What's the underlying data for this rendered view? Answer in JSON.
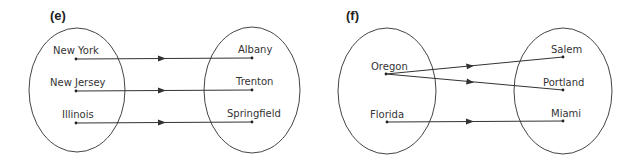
{
  "panels": [
    {
      "label": "(e)",
      "domain": [
        "New York",
        "New Jersey",
        "Illinois"
      ],
      "codomain": [
        "Albany",
        "Trenton",
        "Springfield"
      ],
      "mappings": [
        {
          "from": "New York",
          "to": "Albany"
        },
        {
          "from": "New Jersey",
          "to": "Trenton"
        },
        {
          "from": "Illinois",
          "to": "Springfield"
        }
      ]
    },
    {
      "label": "(f)",
      "domain": [
        "Oregon",
        "Florida"
      ],
      "codomain": [
        "Salem",
        "Portland",
        "Miami"
      ],
      "mappings": [
        {
          "from": "Oregon",
          "to": "Salem"
        },
        {
          "from": "Oregon",
          "to": "Portland"
        },
        {
          "from": "Florida",
          "to": "Miami"
        }
      ]
    }
  ],
  "colors": {
    "stroke": "#333333",
    "background": "#ffffff"
  }
}
